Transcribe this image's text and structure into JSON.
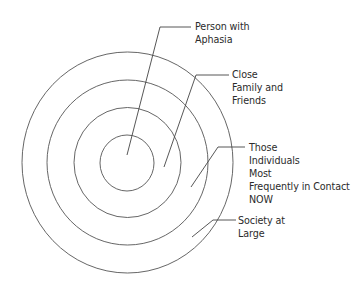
{
  "diagram": {
    "type": "concentric-circles",
    "colors": {
      "stroke": "#555555",
      "text": "#2b2b2b",
      "background": "#ffffff"
    },
    "circles": [
      {
        "name": "person-with-aphasia",
        "cx": 127,
        "cy": 163,
        "rx": 27,
        "ry": 28
      },
      {
        "name": "close-family-and-friends",
        "cx": 127.5,
        "cy": 162.5,
        "rx": 53.5,
        "ry": 55
      },
      {
        "name": "individuals-most-frequently-in-contact",
        "cx": 127.5,
        "cy": 162.5,
        "rx": 80.5,
        "ry": 82.5
      },
      {
        "name": "society-at-large",
        "cx": 127.5,
        "cy": 162.5,
        "rx": 105.5,
        "ry": 110.5
      }
    ],
    "labels": [
      {
        "id": "person",
        "lines": [
          "Person with",
          "Aphasia"
        ],
        "x": 195,
        "y": 20,
        "leader": {
          "from": [
            127,
            155
          ],
          "corner": [
            160,
            27
          ],
          "to": [
            191,
            27
          ]
        }
      },
      {
        "id": "family",
        "lines": [
          "Close",
          "Family and",
          "Friends"
        ],
        "x": 232,
        "y": 68,
        "leader": {
          "from": [
            164,
            167
          ],
          "corner": [
            196,
            75
          ],
          "to": [
            229,
            75
          ]
        }
      },
      {
        "id": "contacts",
        "lines": [
          "Those",
          "Individuals",
          "Most",
          "Frequently in Contact",
          "NOW"
        ],
        "x": 249,
        "y": 141,
        "leader": {
          "from": [
            191,
            187
          ],
          "corner": [
            218,
            147
          ],
          "to": [
            245,
            147
          ]
        }
      },
      {
        "id": "society",
        "lines": [
          "Society at",
          "Large"
        ],
        "x": 238,
        "y": 214,
        "leader": {
          "from": [
            192,
            237
          ],
          "corner": [
            213,
            220
          ],
          "to": [
            236,
            220
          ]
        }
      }
    ]
  }
}
